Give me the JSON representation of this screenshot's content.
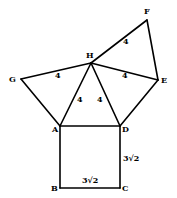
{
  "diagram": {
    "type": "geometry-figure",
    "vertices": [
      {
        "id": "F",
        "label": "F"
      },
      {
        "id": "H",
        "label": "H"
      },
      {
        "id": "G",
        "label": "G"
      },
      {
        "id": "E",
        "label": "E"
      },
      {
        "id": "A",
        "label": "A"
      },
      {
        "id": "D",
        "label": "D"
      },
      {
        "id": "B",
        "label": "B"
      },
      {
        "id": "C",
        "label": "C"
      }
    ],
    "edges": [
      {
        "from": "H",
        "to": "F"
      },
      {
        "from": "F",
        "to": "E"
      },
      {
        "from": "H",
        "to": "E"
      },
      {
        "from": "H",
        "to": "G"
      },
      {
        "from": "G",
        "to": "A"
      },
      {
        "from": "H",
        "to": "A"
      },
      {
        "from": "H",
        "to": "D"
      },
      {
        "from": "E",
        "to": "D"
      },
      {
        "from": "A",
        "to": "D"
      },
      {
        "from": "A",
        "to": "B"
      },
      {
        "from": "B",
        "to": "C"
      },
      {
        "from": "C",
        "to": "D"
      }
    ],
    "side_labels": [
      {
        "edge": "HF",
        "text": "4"
      },
      {
        "edge": "GH",
        "text": "4"
      },
      {
        "edge": "HE",
        "text": "4"
      },
      {
        "edge": "HA",
        "text": "4"
      },
      {
        "edge": "HD",
        "text": "4"
      },
      {
        "edge": "BC",
        "text": "3√2"
      },
      {
        "edge": "DC",
        "text": "3√2"
      }
    ]
  }
}
